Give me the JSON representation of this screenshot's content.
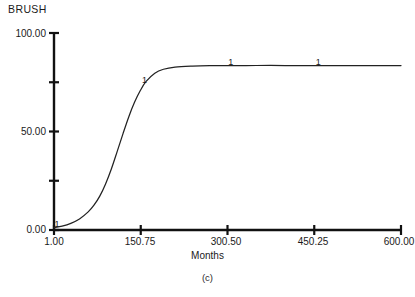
{
  "figure": {
    "series_title": "BRUSH",
    "caption": "(c)"
  },
  "axes": {
    "x_title": "Months",
    "y_title": "",
    "y_tick_labels": [
      "100.00",
      "50.00",
      "0.00"
    ],
    "x_tick_labels": [
      "1.00",
      "150.75",
      "300.50",
      "450.25",
      "600.00"
    ]
  },
  "markers": {
    "symbol": "1",
    "label_1": "1",
    "label_2": "1",
    "label_3": "1",
    "label_4": "1"
  },
  "chart_data": {
    "type": "line",
    "title": "BRUSH",
    "subtitle": "(c)",
    "xlabel": "Months",
    "ylabel": "BRUSH",
    "xlim": [
      1.0,
      600.0
    ],
    "ylim": [
      0.0,
      100.0
    ],
    "grid": false,
    "legend_position": "none",
    "x_major_ticks": [
      1.0,
      150.75,
      300.5,
      450.25,
      600.0
    ],
    "x_tick_labels": [
      "1.00",
      "150.75",
      "300.50",
      "450.25",
      "600.00"
    ],
    "y_major_ticks": [
      0.0,
      50.0,
      100.0
    ],
    "y_minor_ticks": [
      25.0,
      75.0
    ],
    "y_tick_labels": [
      "0.00",
      "50.00",
      "100.00"
    ],
    "series": [
      {
        "name": "1",
        "marker_symbol": "1",
        "marker_x": [
          1.0,
          152.0,
          301.0,
          452.0
        ],
        "marker_y": [
          1.2,
          74.0,
          83.4,
          83.5
        ],
        "x": [
          1,
          15,
          30,
          45,
          60,
          70,
          80,
          90,
          100,
          110,
          120,
          130,
          140,
          150,
          160,
          175,
          190,
          210,
          240,
          270,
          300,
          350,
          400,
          450,
          500,
          550,
          600
        ],
        "y": [
          1.2,
          2.0,
          3.4,
          5.6,
          9.2,
          12.6,
          17.2,
          23.4,
          31.0,
          39.8,
          48.8,
          57.4,
          64.8,
          70.8,
          75.4,
          79.6,
          81.6,
          82.7,
          83.2,
          83.4,
          83.4,
          83.5,
          83.5,
          83.5,
          83.5,
          83.5,
          83.5
        ]
      }
    ],
    "annotations": [
      {
        "text": "1",
        "x": 1.0,
        "y": 1.2
      },
      {
        "text": "1",
        "x": 152.0,
        "y": 74.0
      },
      {
        "text": "1",
        "x": 301.0,
        "y": 83.4
      },
      {
        "text": "1",
        "x": 452.0,
        "y": 83.5
      }
    ]
  },
  "colors": {
    "axis": "#111111",
    "curve": "#222222",
    "background": "#ffffff",
    "text": "#1a1a1a"
  }
}
